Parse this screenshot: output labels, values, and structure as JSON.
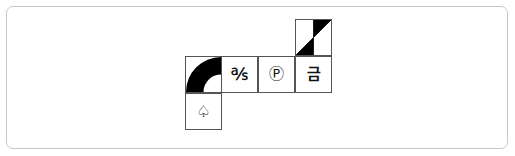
{
  "diagram": {
    "tiles": [
      {
        "id": "arc",
        "content": "quarter-annulus",
        "icon": "quarter-arc-icon",
        "fill": "#000000"
      },
      {
        "id": "as",
        "content": "℁"
      },
      {
        "id": "p",
        "content": "Ⓟ"
      },
      {
        "id": "kr",
        "content": "금"
      },
      {
        "id": "diag",
        "content": "diagonal-split",
        "icon": "diagonal-triangles-icon",
        "fill": "#000000"
      },
      {
        "id": "spade",
        "content": "♤"
      }
    ]
  },
  "colors": {
    "border": "#555555",
    "frame_border": "#c8c8c8",
    "fill": "#000000",
    "background": "#ffffff"
  }
}
